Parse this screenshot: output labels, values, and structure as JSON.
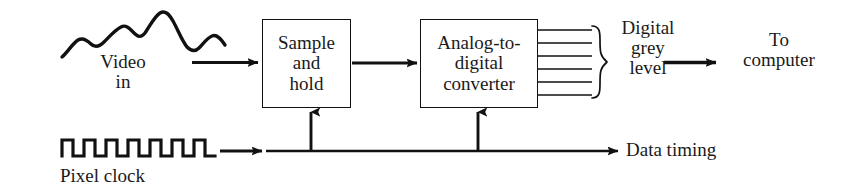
{
  "figure": {
    "kind": "block-diagram",
    "title_text": "",
    "background_color": "#ffffff",
    "line_color": "#111111",
    "text_color": "#1a1a1a"
  },
  "blocks": [
    {
      "id": "sample-and-hold",
      "label_lines": [
        "Sample",
        "and",
        "hold"
      ],
      "label": "Sample and hold"
    },
    {
      "id": "analog-to-digital-converter",
      "label_lines": [
        "Analog-to-",
        "digital",
        "converter"
      ],
      "label": "Analog-to-digital converter"
    }
  ],
  "labels": {
    "video_in_line1": "Video",
    "video_in_line2": "in",
    "digital_grey_level_line1": "Digital",
    "digital_grey_level_line2": "grey",
    "digital_grey_level_line3": "level",
    "to_computer_line1": "To",
    "to_computer_line2": "computer",
    "pixel_clock": "Pixel clock",
    "data_timing": "Data timing"
  },
  "signals": {
    "video_waveform": "analog-squiggle",
    "pixel_clock_waveform": "square-wave",
    "pixel_clock_pulse_count": 7,
    "digital_output_line_count": 6,
    "brace": "right-curly-brace"
  },
  "connections": [
    {
      "from": "video-in",
      "to": "sample-and-hold",
      "style": "arrow"
    },
    {
      "from": "sample-and-hold",
      "to": "analog-to-digital-converter",
      "style": "arrow"
    },
    {
      "from": "analog-to-digital-converter",
      "to": "digital-grey-level",
      "style": "parallel-lines"
    },
    {
      "from": "digital-grey-level",
      "to": "to-computer",
      "style": "arrow"
    },
    {
      "from": "pixel-clock",
      "to": "data-timing-bus",
      "style": "arrow"
    },
    {
      "from": "data-timing-bus",
      "to": "sample-and-hold",
      "style": "arrow-up"
    },
    {
      "from": "data-timing-bus",
      "to": "analog-to-digital-converter",
      "style": "arrow-up"
    },
    {
      "from": "data-timing-bus",
      "to": "data-timing",
      "style": "arrow"
    }
  ]
}
